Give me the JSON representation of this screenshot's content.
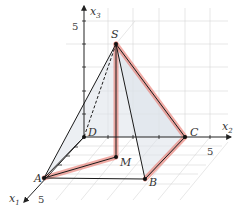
{
  "diagram": {
    "title": "",
    "type": "3d-pyramid",
    "axes": {
      "x1": {
        "label": "x",
        "sub": "1",
        "tick": "5"
      },
      "x2": {
        "label": "x",
        "sub": "2",
        "tick": "5"
      },
      "x3": {
        "label": "x",
        "sub": "3",
        "tick": "5"
      }
    },
    "points": {
      "S": "S",
      "A": "A",
      "B": "B",
      "C": "C",
      "D": "D",
      "M": "M"
    },
    "colors": {
      "edge": "#1a1a1a",
      "highlight": "#e8756a",
      "face": "#d8dde6",
      "grid": "#cfcfcf"
    },
    "highlighted_path": [
      "A",
      "M",
      "S",
      "C",
      "B"
    ]
  }
}
